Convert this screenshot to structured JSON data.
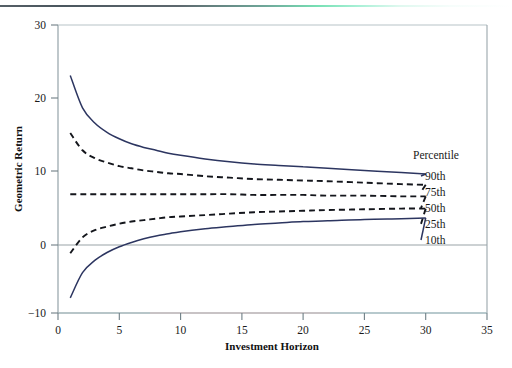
{
  "chart_data": {
    "type": "line",
    "title": "",
    "xlabel": "Investment Horizon",
    "ylabel": "Geometric Return",
    "xlim": [
      0,
      35
    ],
    "ylim": [
      -10,
      30
    ],
    "xticks": [
      0,
      5,
      10,
      15,
      20,
      25,
      30,
      35
    ],
    "yticks": [
      -10,
      0,
      10,
      20,
      30
    ],
    "xtick_labels": [
      "0",
      "5",
      "10",
      "15",
      "20",
      "25",
      "30",
      "35"
    ],
    "ytick_labels": [
      "−10",
      "0",
      "10",
      "20",
      "30"
    ],
    "grid": false,
    "legend_position": "right",
    "legend_title": "Percentile",
    "zero_line": true,
    "x": [
      1,
      2,
      3,
      4,
      5,
      6,
      7,
      8,
      9,
      10,
      12,
      14,
      16,
      18,
      20,
      22,
      25,
      28,
      30
    ],
    "series": [
      {
        "name": "90th",
        "style": "solid",
        "color": "#2c3560",
        "values": [
          23.0,
          18.5,
          16.4,
          15.1,
          14.2,
          13.5,
          13.0,
          12.6,
          12.2,
          11.9,
          11.4,
          11.0,
          10.7,
          10.5,
          10.3,
          10.1,
          9.8,
          9.5,
          9.3
        ]
      },
      {
        "name": "75th",
        "style": "dashed",
        "color": "#14161c",
        "values": [
          15.0,
          12.6,
          11.5,
          10.9,
          10.4,
          10.1,
          9.8,
          9.6,
          9.4,
          9.3,
          9.0,
          8.8,
          8.6,
          8.5,
          8.4,
          8.3,
          8.1,
          7.9,
          7.8
        ]
      },
      {
        "name": "50th",
        "style": "dashed",
        "color": "#14161c",
        "values": [
          6.5,
          6.5,
          6.5,
          6.5,
          6.5,
          6.5,
          6.5,
          6.5,
          6.5,
          6.5,
          6.5,
          6.5,
          6.4,
          6.4,
          6.4,
          6.3,
          6.3,
          6.2,
          6.2
        ]
      },
      {
        "name": "25th",
        "style": "dashed",
        "color": "#14161c",
        "values": [
          -1.7,
          0.5,
          1.5,
          2.0,
          2.4,
          2.7,
          2.9,
          3.1,
          3.3,
          3.4,
          3.6,
          3.8,
          4.0,
          4.1,
          4.2,
          4.3,
          4.4,
          4.5,
          4.5
        ]
      },
      {
        "name": "10th",
        "style": "solid",
        "color": "#2c3560",
        "values": [
          -7.9,
          -4.4,
          -2.7,
          -1.6,
          -0.8,
          -0.2,
          0.3,
          0.7,
          1.0,
          1.3,
          1.7,
          2.0,
          2.3,
          2.5,
          2.7,
          2.8,
          3.0,
          3.1,
          3.2
        ]
      }
    ]
  },
  "legend": {
    "title": "Percentile",
    "entries": [
      {
        "label": "90th",
        "style": "solid",
        "color": "#2c3560"
      },
      {
        "label": "75th",
        "style": "dashed",
        "color": "#14161c"
      },
      {
        "label": "50th",
        "style": "dashed",
        "color": "#14161c"
      },
      {
        "label": "25th",
        "style": "dashed",
        "color": "#14161c"
      },
      {
        "label": "10th",
        "style": "solid",
        "color": "#2c3560"
      }
    ]
  },
  "axes": {
    "x_title": "Investment Horizon",
    "y_title": "Geometric Return",
    "x_ticks": [
      "0",
      "5",
      "10",
      "15",
      "20",
      "25",
      "30",
      "35"
    ],
    "y_ticks": [
      "30",
      "20",
      "10",
      "0",
      "−10"
    ]
  },
  "decor": {
    "top_rule_colors": [
      "#555f66",
      "#77e0b4",
      "#ffffff"
    ],
    "axis_color": "#8a9aa0",
    "zero_line_color": "#9aa3a8"
  }
}
